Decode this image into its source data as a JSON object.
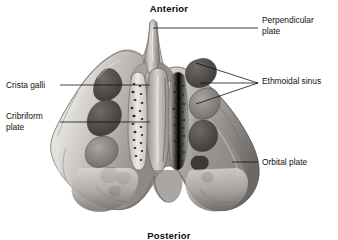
{
  "figure": {
    "orientation": {
      "anterior": "Anterior",
      "posterior": "Posterior"
    },
    "background_color": "#ffffff",
    "ink_color": "#111111",
    "bone_light": "#e8e6e3",
    "bone_mid": "#b9b5b1",
    "bone_dark": "#6f6b68",
    "cavity_dark": "#4a4744",
    "labels": [
      {
        "id": "perpendicular-plate",
        "text": "Perpendicular\nplate",
        "side": "right",
        "leader": "single"
      },
      {
        "id": "ethmoidal-sinus",
        "text": "Ethmoidal sinus",
        "side": "right",
        "leader": "three-prong-fork"
      },
      {
        "id": "orbital-plate",
        "text": "Orbital plate",
        "side": "right",
        "leader": "single"
      },
      {
        "id": "crista-galli",
        "text": "Crista galli",
        "side": "left",
        "leader": "single"
      },
      {
        "id": "cribriform-plate",
        "text": "Cribriform\nplate",
        "side": "left",
        "leader": "single"
      }
    ]
  }
}
